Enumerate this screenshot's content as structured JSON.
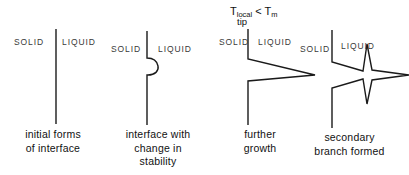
{
  "figure": {
    "background_color": "#ffffff",
    "line_color": "#1a1a1a",
    "text_color": "#111111",
    "phase_label_color": "#3a3a3a"
  },
  "panels": [
    {
      "id": "panel-1",
      "solid_label": "SOLID",
      "liquid_label": "LIQUID",
      "caption": "initial forms\nof interface",
      "annotation": null,
      "shape": "straight-vertical-interface"
    },
    {
      "id": "panel-2",
      "solid_label": "SOLID",
      "liquid_label": "LIQUID",
      "caption": "interface with\nchange in\nstability",
      "annotation": null,
      "shape": "vertical-interface-with-rounded-bulge"
    },
    {
      "id": "panel-3",
      "solid_label": "SOLID",
      "liquid_label": "LIQUID",
      "caption": "further\ngrowth",
      "annotation": {
        "base": "T",
        "subscript": "local",
        "subscript_second_line": "tip",
        "relation": "<",
        "right_base": "T",
        "right_subscript": "m",
        "full_text": "Tlocal tip < Tm"
      },
      "shape": "vertical-interface-with-sharp-spike"
    },
    {
      "id": "panel-4",
      "solid_label": "SOLID",
      "liquid_label": "LIQUID",
      "caption": "secondary\nbranch formed",
      "annotation": null,
      "shape": "dendrite-with-secondary-branches"
    }
  ]
}
